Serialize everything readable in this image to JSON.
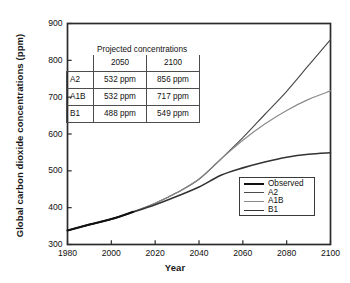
{
  "chart_data": {
    "type": "line",
    "title": "",
    "xlabel": "Year",
    "ylabel": "Global carbon dioxide concentrations (ppm)",
    "xlim": [
      1980,
      2100
    ],
    "ylim": [
      300,
      900
    ],
    "xticks": [
      "1980",
      "2000",
      "2020",
      "2040",
      "2060",
      "2080",
      "2100"
    ],
    "yticks": [
      "300",
      "400",
      "500",
      "600",
      "700",
      "800",
      "900"
    ],
    "grid": false,
    "legend_position": "lower right",
    "legend_entries": [
      "Observed",
      "A2",
      "A1B",
      "B1"
    ],
    "x": [
      1980,
      1990,
      2000,
      2010,
      2020,
      2030,
      2040,
      2050,
      2060,
      2070,
      2080,
      2090,
      2100
    ],
    "series": [
      {
        "name": "Observed",
        "color": "#111111",
        "width": 2.1,
        "values": [
          338,
          354,
          369,
          389,
          null,
          null,
          null,
          null,
          null,
          null,
          null,
          null,
          null
        ]
      },
      {
        "name": "A2",
        "color": "#4a4a4a",
        "width": 1.15,
        "values": [
          338,
          354,
          369,
          389,
          412,
          441,
          477,
          532,
          590,
          653,
          716,
          786,
          856
        ]
      },
      {
        "name": "A1B",
        "color": "#8a8a8a",
        "width": 1.15,
        "values": [
          338,
          354,
          369,
          389,
          412,
          441,
          478,
          532,
          583,
          627,
          664,
          694,
          717
        ]
      },
      {
        "name": "B1",
        "color": "#333333",
        "width": 1.6,
        "values": [
          338,
          354,
          369,
          388,
          408,
          431,
          456,
          488,
          508,
          524,
          537,
          545,
          549
        ]
      }
    ],
    "annotations": {
      "inset_table": {
        "title": "Projected concentrations",
        "columns": [
          "2050",
          "2100"
        ],
        "rows": [
          {
            "label": "A2",
            "cells": [
              "532 ppm",
              "856 ppm"
            ]
          },
          {
            "label": "A1B",
            "cells": [
              "532 ppm",
              "717 ppm"
            ]
          },
          {
            "label": "B1",
            "cells": [
              "488 ppm",
              "549 ppm"
            ]
          }
        ]
      }
    }
  },
  "axis_color": "#2b2b2b"
}
